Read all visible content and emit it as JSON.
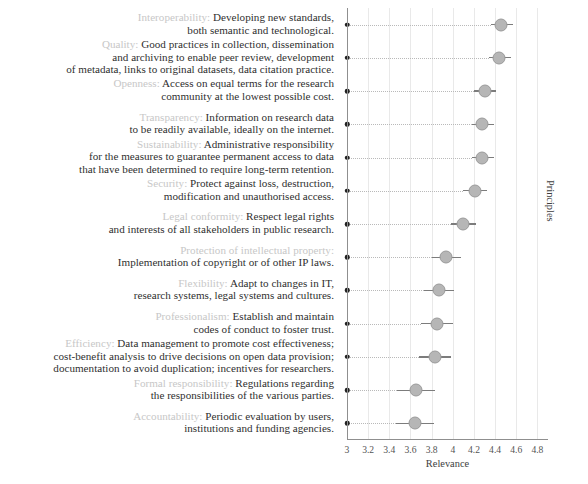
{
  "chart_data": {
    "type": "scatter",
    "title": "",
    "xlabel": "Relevance",
    "ylabel": "Principles",
    "xlim": [
      3,
      4.9
    ],
    "grid": true,
    "legend": "none",
    "xticks": [
      "3",
      "3.2",
      "3.4",
      "3.6",
      "3.8",
      "4",
      "4.2",
      "4.4",
      "4.6",
      "4.8"
    ],
    "xtick_values": [
      3,
      3.2,
      3.4,
      3.6,
      3.8,
      4,
      4.2,
      4.4,
      4.6,
      4.8
    ],
    "categories": [
      "Interoperability",
      "Quality",
      "Openness",
      "Transparency",
      "Sustainability",
      "Security",
      "Legal conformity",
      "Protection of intellectual property",
      "Flexibility",
      "Professionalism",
      "Efficiency",
      "Formal responsibility",
      "Accountability"
    ],
    "values": [
      4.46,
      4.44,
      4.3,
      4.28,
      4.28,
      4.21,
      4.1,
      3.94,
      3.87,
      3.85,
      3.83,
      3.65,
      3.64
    ],
    "error_low": [
      4.36,
      4.34,
      4.2,
      4.18,
      4.18,
      4.1,
      3.98,
      3.8,
      3.73,
      3.7,
      3.68,
      3.47,
      3.46
    ],
    "error_high": [
      4.57,
      4.55,
      4.41,
      4.39,
      4.39,
      4.32,
      4.22,
      4.08,
      4.01,
      4.0,
      3.98,
      3.83,
      3.82
    ],
    "rows": [
      {
        "principle": "Interoperability",
        "description": "Developing new standards, both semantic and technological.",
        "lines": [
          {
            "pname": "Interoperability:",
            "text": " Developing new standards,"
          },
          {
            "pname": "",
            "text": "both semantic and technological."
          }
        ],
        "value": 4.46,
        "low": 4.36,
        "high": 4.57
      },
      {
        "principle": "Quality",
        "description": "Good practices in collection, dissemination and archiving to enable peer review, development of metadata, links to original datasets, data citation practice.",
        "lines": [
          {
            "pname": "Quality:",
            "text": " Good practices in collection, dissemination"
          },
          {
            "pname": "",
            "text": "and archiving to enable peer review, development"
          },
          {
            "pname": "",
            "text": "of metadata, links to original datasets, data citation practice."
          }
        ],
        "value": 4.44,
        "low": 4.34,
        "high": 4.55
      },
      {
        "principle": "Openness",
        "description": "Access on equal terms for the research community at the lowest possible cost.",
        "lines": [
          {
            "pname": "Openness:",
            "text": " Access on equal terms for the research"
          },
          {
            "pname": "",
            "text": "community at the lowest possible cost."
          }
        ],
        "value": 4.3,
        "low": 4.2,
        "high": 4.41
      },
      {
        "principle": "Transparency",
        "description": "Information on research data to be readily available, ideally on the internet.",
        "lines": [
          {
            "pname": "Transparency:",
            "text": " Information on research data"
          },
          {
            "pname": "",
            "text": "to be readily available, ideally on the internet."
          }
        ],
        "value": 4.28,
        "low": 4.18,
        "high": 4.39
      },
      {
        "principle": "Sustainability",
        "description": "Administrative responsibility for the measures to guarantee permanent access to data that have been determined to require long-term retention.",
        "lines": [
          {
            "pname": "Sustainability:",
            "text": " Administrative responsibility"
          },
          {
            "pname": "",
            "text": "for the measures to guarantee permanent access to data"
          },
          {
            "pname": "",
            "text": "that have been determined to require long-term retention."
          }
        ],
        "value": 4.28,
        "low": 4.18,
        "high": 4.39
      },
      {
        "principle": "Security",
        "description": "Protect against loss, destruction, modification and unauthorised access.",
        "lines": [
          {
            "pname": "Security:",
            "text": " Protect against loss, destruction,"
          },
          {
            "pname": "",
            "text": "modification and unauthorised access."
          }
        ],
        "value": 4.21,
        "low": 4.1,
        "high": 4.32
      },
      {
        "principle": "Legal conformity",
        "description": "Respect legal rights and interests of all stakeholders in public research.",
        "lines": [
          {
            "pname": "Legal conformity:",
            "text": " Respect legal rights"
          },
          {
            "pname": "",
            "text": "and interests of all stakeholders in public research."
          }
        ],
        "value": 4.1,
        "low": 3.98,
        "high": 4.22
      },
      {
        "principle": "Protection of intellectual property",
        "description": "Implementation of copyright or of other IP laws.",
        "lines": [
          {
            "pname": "Protection of intellectual property:",
            "text": ""
          },
          {
            "pname": "",
            "text": "Implementation of copyright or of other IP laws."
          }
        ],
        "value": 3.94,
        "low": 3.8,
        "high": 4.08
      },
      {
        "principle": "Flexibility",
        "description": "Adapt to changes in IT, research systems, legal systems and cultures.",
        "lines": [
          {
            "pname": "Flexibility:",
            "text": " Adapt to changes in IT,"
          },
          {
            "pname": "",
            "text": "research systems, legal systems and cultures."
          }
        ],
        "value": 3.87,
        "low": 3.73,
        "high": 4.01
      },
      {
        "principle": "Professionalism",
        "description": "Establish and maintain codes of conduct to foster trust.",
        "lines": [
          {
            "pname": "Professionalism:",
            "text": " Establish and maintain"
          },
          {
            "pname": "",
            "text": "codes of conduct to foster trust."
          }
        ],
        "value": 3.85,
        "low": 3.7,
        "high": 4.0
      },
      {
        "principle": "Efficiency",
        "description": "Data management to promote cost effectiveness; cost-benefit analysis to drive decisions on open data provision; documentation to avoid duplication; incentives for researchers.",
        "lines": [
          {
            "pname": "Efficiency:",
            "text": " Data management to promote cost effectiveness;"
          },
          {
            "pname": "",
            "text": "cost-benefit analysis to drive decisions on open data provision;"
          },
          {
            "pname": "",
            "text": "documentation to avoid duplication; incentives for researchers."
          }
        ],
        "value": 3.83,
        "low": 3.68,
        "high": 3.98
      },
      {
        "principle": "Formal responsibility",
        "description": "Regulations regarding the responsibilities of the various parties.",
        "lines": [
          {
            "pname": "Formal responsibility:",
            "text": " Regulations regarding"
          },
          {
            "pname": "",
            "text": "the responsibilities of the various parties."
          }
        ],
        "value": 3.65,
        "low": 3.47,
        "high": 3.83
      },
      {
        "principle": "Accountability",
        "description": "Periodic evaluation by users, institutions and funding agencies.",
        "lines": [
          {
            "pname": "Accountability:",
            "text": " Periodic evaluation by users,"
          },
          {
            "pname": "",
            "text": "institutions and funding agencies."
          }
        ],
        "value": 3.64,
        "low": 3.46,
        "high": 3.82
      }
    ]
  },
  "colors": {
    "dot_fill": "#b6b6b6",
    "dot_stroke": "#9a9a9a",
    "errorbar": "#7c7c7c",
    "axis": "#8f8f8f",
    "grid": "#e9e9e9",
    "principle_name": "#c7c7c7",
    "text": "#2f2f2f",
    "axis_dot": "#222222"
  }
}
